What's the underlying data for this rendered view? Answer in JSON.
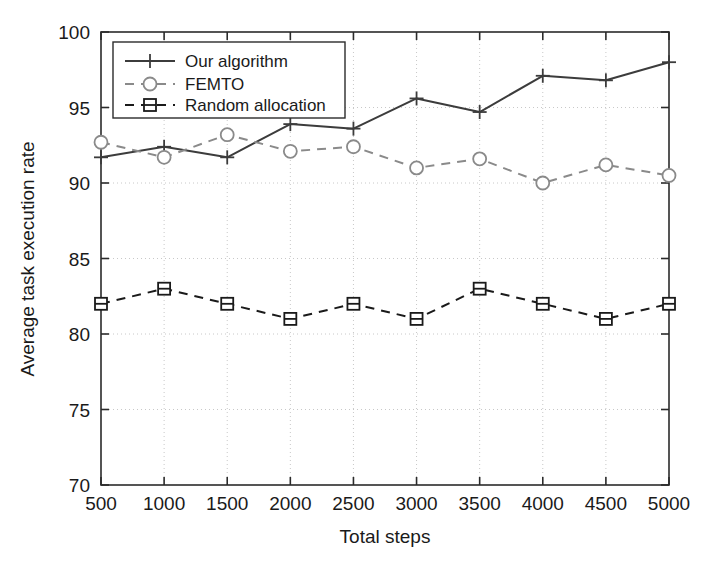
{
  "chart_data": {
    "type": "line",
    "title": "",
    "xlabel": "Total steps",
    "ylabel": "Average task execution rate",
    "x": [
      500,
      1000,
      1500,
      2000,
      2500,
      3000,
      3500,
      4000,
      4500,
      5000
    ],
    "xtick_labels": [
      "500",
      "1000",
      "1500",
      "2000",
      "2500",
      "3000",
      "3500",
      "4000",
      "4500",
      "5000"
    ],
    "ytick_labels": [
      "70",
      "75",
      "80",
      "85",
      "90",
      "95",
      "100"
    ],
    "xlim": [
      500,
      5000
    ],
    "ylim": [
      70,
      100
    ],
    "grid": true,
    "legend_position": "top-left",
    "series": [
      {
        "name": "Our algorithm",
        "marker": "plus",
        "linestyle": "solid",
        "color": "#3c3c3c",
        "values": [
          91.7,
          92.4,
          91.7,
          93.9,
          93.6,
          95.6,
          94.7,
          97.1,
          96.8,
          98.0
        ]
      },
      {
        "name": "FEMTO",
        "marker": "circle",
        "linestyle": "dashed",
        "color": "#8a8a8a",
        "values": [
          92.7,
          91.7,
          93.2,
          92.1,
          92.4,
          91.0,
          91.6,
          90.0,
          91.2,
          90.5
        ]
      },
      {
        "name": "Random allocation",
        "marker": "square",
        "linestyle": "dashed",
        "color": "#1a1a1a",
        "values": [
          82.0,
          83.0,
          82.0,
          81.0,
          82.0,
          81.0,
          83.0,
          82.0,
          81.0,
          82.0
        ]
      }
    ]
  },
  "legend": {
    "entries": [
      {
        "label": "Our algorithm"
      },
      {
        "label": "FEMTO"
      },
      {
        "label": "Random allocation"
      }
    ]
  },
  "colors": {
    "axis": "#2b2b2b",
    "grid": "#c8c8c8",
    "series_primary": "#3c3c3c",
    "series_secondary": "#8a8a8a",
    "series_tertiary": "#1a1a1a",
    "background": "#ffffff"
  }
}
